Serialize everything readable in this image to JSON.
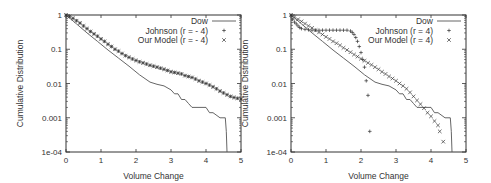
{
  "chart_data": [
    {
      "type": "line",
      "id": "left",
      "xlabel": "Volume Change",
      "ylabel": "Cumulative Distribution",
      "xlim": [
        0,
        5
      ],
      "ylim": [
        0.0001,
        1
      ],
      "yscale": "log",
      "xticks": [
        "0",
        "1",
        "2",
        "3",
        "4",
        "5"
      ],
      "yticks": [
        "1",
        "0.1",
        "0.01",
        "0.001",
        "1e-04"
      ],
      "legend_position": "top-right",
      "series": [
        {
          "name": "Dow",
          "style": "line",
          "x": [
            0,
            0.3,
            0.6,
            0.9,
            1.2,
            1.5,
            1.8,
            2.1,
            2.4,
            2.6,
            2.8,
            3.0,
            3.1,
            3.2,
            3.3,
            3.4,
            3.5,
            3.6,
            3.8,
            4.0,
            4.1,
            4.2,
            4.4,
            4.55,
            4.58,
            4.6
          ],
          "y": [
            1,
            0.55,
            0.3,
            0.17,
            0.095,
            0.055,
            0.032,
            0.018,
            0.011,
            0.0095,
            0.0085,
            0.0065,
            0.005,
            0.005,
            0.0034,
            0.0034,
            0.0026,
            0.002,
            0.002,
            0.002,
            0.0014,
            0.0014,
            0.001,
            0.001,
            0.0004,
            0.0001
          ]
        },
        {
          "name": "Johnson (r = - 4)",
          "style": "plus",
          "x": [
            0,
            0.1,
            0.2,
            0.3,
            0.4,
            0.5,
            0.6,
            0.7,
            0.8,
            0.9,
            1.0,
            1.1,
            1.2,
            1.3,
            1.4,
            1.5,
            1.6,
            1.7,
            1.8,
            1.9,
            2.0,
            2.1,
            2.2,
            2.3,
            2.4,
            2.5,
            2.6,
            2.7,
            2.8,
            2.9,
            3.0,
            3.1,
            3.2,
            3.3,
            3.4,
            3.5,
            3.6,
            3.7,
            3.8,
            3.9,
            4.0,
            4.1,
            4.2,
            4.3,
            4.4,
            4.5,
            4.6,
            4.7,
            4.8,
            4.9,
            5.0
          ],
          "y": [
            1,
            0.9,
            0.8,
            0.68,
            0.58,
            0.48,
            0.4,
            0.33,
            0.28,
            0.24,
            0.2,
            0.17,
            0.14,
            0.12,
            0.1,
            0.088,
            0.075,
            0.065,
            0.058,
            0.052,
            0.047,
            0.043,
            0.04,
            0.037,
            0.034,
            0.032,
            0.03,
            0.028,
            0.026,
            0.024,
            0.022,
            0.021,
            0.02,
            0.019,
            0.017,
            0.016,
            0.015,
            0.0135,
            0.012,
            0.011,
            0.01,
            0.009,
            0.008,
            0.007,
            0.006,
            0.0053,
            0.0047,
            0.0042,
            0.0039,
            0.0037,
            0.0035
          ]
        },
        {
          "name": "Our Model (r = - 4)",
          "style": "cross",
          "x": [
            0,
            0.1,
            0.2,
            0.3,
            0.4,
            0.5,
            0.6,
            0.7,
            0.8,
            0.9,
            1.0,
            1.1,
            1.2,
            1.3,
            1.4,
            1.5,
            1.6,
            1.7,
            1.8,
            1.9,
            2.0,
            2.1,
            2.2,
            2.3,
            2.4,
            2.5,
            2.6,
            2.7,
            2.8,
            2.9,
            3.0,
            3.1,
            3.2,
            3.3,
            3.4,
            3.5,
            3.6,
            3.7,
            3.8,
            3.9,
            4.0,
            4.1,
            4.2,
            4.3,
            4.4,
            4.5,
            4.6,
            4.7,
            4.8,
            4.9,
            5.0
          ],
          "y": [
            1,
            0.9,
            0.8,
            0.68,
            0.58,
            0.48,
            0.4,
            0.33,
            0.28,
            0.24,
            0.2,
            0.17,
            0.14,
            0.12,
            0.1,
            0.088,
            0.075,
            0.065,
            0.058,
            0.052,
            0.047,
            0.043,
            0.04,
            0.037,
            0.034,
            0.032,
            0.03,
            0.028,
            0.026,
            0.024,
            0.022,
            0.021,
            0.02,
            0.019,
            0.017,
            0.016,
            0.015,
            0.0135,
            0.012,
            0.011,
            0.01,
            0.009,
            0.008,
            0.007,
            0.006,
            0.0053,
            0.0047,
            0.0042,
            0.0039,
            0.0037,
            0.0035
          ]
        }
      ]
    },
    {
      "type": "line",
      "id": "right",
      "xlabel": "Volume Change",
      "ylabel": "Cumulative Distribution",
      "xlim": [
        0,
        5
      ],
      "ylim": [
        0.0001,
        1
      ],
      "yscale": "log",
      "xticks": [
        "0",
        "1",
        "2",
        "3",
        "4",
        "5"
      ],
      "yticks": [
        "1",
        "0.1",
        "0.01",
        "0.001",
        "1e-04"
      ],
      "legend_position": "top-right",
      "series": [
        {
          "name": "Dow",
          "style": "line",
          "x": [
            0,
            0.3,
            0.6,
            0.9,
            1.2,
            1.5,
            1.8,
            2.1,
            2.4,
            2.6,
            2.8,
            3.0,
            3.1,
            3.2,
            3.3,
            3.4,
            3.5,
            3.6,
            3.8,
            4.0,
            4.1,
            4.2,
            4.4,
            4.55,
            4.58,
            4.6
          ],
          "y": [
            1,
            0.55,
            0.3,
            0.17,
            0.095,
            0.055,
            0.032,
            0.018,
            0.011,
            0.0095,
            0.0085,
            0.0065,
            0.005,
            0.005,
            0.0034,
            0.0034,
            0.0026,
            0.002,
            0.002,
            0.002,
            0.0014,
            0.0014,
            0.001,
            0.001,
            0.0004,
            0.0001
          ]
        },
        {
          "name": "Johnson (r = 4)",
          "style": "plus",
          "x": [
            0,
            0.05,
            0.1,
            0.15,
            0.2,
            0.25,
            0.3,
            0.4,
            0.5,
            0.6,
            0.7,
            0.8,
            0.9,
            1.0,
            1.1,
            1.2,
            1.3,
            1.4,
            1.5,
            1.6,
            1.7,
            1.75,
            1.8,
            1.85,
            1.9,
            1.95,
            2.0,
            2.05,
            2.1,
            2.15,
            2.2,
            2.25
          ],
          "y": [
            1,
            0.75,
            0.62,
            0.55,
            0.48,
            0.43,
            0.4,
            0.38,
            0.37,
            0.36,
            0.36,
            0.36,
            0.36,
            0.36,
            0.36,
            0.36,
            0.36,
            0.36,
            0.36,
            0.36,
            0.34,
            0.31,
            0.27,
            0.22,
            0.17,
            0.12,
            0.08,
            0.05,
            0.03,
            0.012,
            0.0045,
            0.0004
          ]
        },
        {
          "name": "Our Model (r = 4)",
          "style": "cross",
          "x": [
            0,
            0.1,
            0.2,
            0.3,
            0.4,
            0.5,
            0.6,
            0.7,
            0.8,
            0.9,
            1.0,
            1.1,
            1.2,
            1.3,
            1.4,
            1.5,
            1.6,
            1.7,
            1.8,
            1.9,
            2.0,
            2.1,
            2.2,
            2.3,
            2.4,
            2.5,
            2.6,
            2.7,
            2.8,
            2.9,
            3.0,
            3.1,
            3.2,
            3.3,
            3.4,
            3.5,
            3.6,
            3.7,
            3.8,
            3.9,
            4.0,
            4.1,
            4.2,
            4.25,
            4.35
          ],
          "y": [
            1,
            0.87,
            0.75,
            0.65,
            0.56,
            0.48,
            0.42,
            0.36,
            0.31,
            0.27,
            0.23,
            0.2,
            0.17,
            0.15,
            0.13,
            0.11,
            0.095,
            0.082,
            0.07,
            0.061,
            0.053,
            0.046,
            0.04,
            0.035,
            0.03,
            0.026,
            0.022,
            0.019,
            0.016,
            0.014,
            0.012,
            0.01,
            0.0085,
            0.007,
            0.0055,
            0.0042,
            0.0032,
            0.0025,
            0.0019,
            0.0014,
            0.0011,
            0.0008,
            0.0006,
            0.0004,
            0.0002
          ]
        }
      ]
    }
  ]
}
